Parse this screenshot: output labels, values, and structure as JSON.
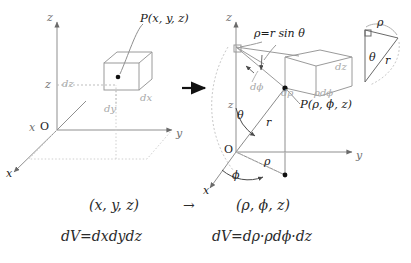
{
  "figure": {
    "type": "math-diagram",
    "background": "#ffffff",
    "transform_arrow": "→"
  },
  "left_diagram": {
    "name": "cartesian-coordinate-system",
    "axes": [
      {
        "id": "z",
        "label": "z"
      },
      {
        "id": "y",
        "label": "y"
      },
      {
        "id": "x",
        "label": "x"
      }
    ],
    "origin_label": "O",
    "height_label": "z",
    "x_near_origin_label": "x",
    "point_label": "P(x, y, z)",
    "cube_edges": [
      {
        "id": "dz",
        "label": "dz"
      },
      {
        "id": "dx",
        "label": "dx"
      },
      {
        "id": "dy",
        "label": "dy"
      }
    ]
  },
  "right_diagram": {
    "name": "cylindrical-coordinate-system",
    "axes": [
      {
        "id": "z",
        "label": "z"
      },
      {
        "id": "y",
        "label": "y"
      },
      {
        "id": "x",
        "label": "x"
      }
    ],
    "origin_label": "O",
    "height_label": "z",
    "point_label": "P(ρ, ϕ, z)",
    "relation_label": "ρ=r sin θ",
    "angle_theta": "θ",
    "angle_phi": "ϕ",
    "radius_r": "r",
    "radius_rho": "ρ",
    "cube_edges": [
      {
        "id": "dz",
        "label": "dz"
      },
      {
        "id": "drho",
        "label": "dρ"
      },
      {
        "id": "rhodphi",
        "label": "ρdϕ"
      },
      {
        "id": "dphi",
        "label": "dϕ"
      }
    ]
  },
  "inset_triangle": {
    "name": "rho-r-theta-triangle",
    "top_label": "ρ",
    "angle_label": "θ",
    "hyp_label": "r"
  },
  "equations": {
    "left_coords": "(x, y, z)",
    "arrow": "→",
    "right_coords": "(ρ, ϕ, z)",
    "left_volume": "dV=dxdydz",
    "right_volume": "dV=dρ·ρdϕ·dz"
  },
  "colors": {
    "ink": "#1a1a1a",
    "light_gray": "#b4b4b4",
    "mid_gray": "#8a8a8a",
    "dotted": "#c8c8c8"
  }
}
